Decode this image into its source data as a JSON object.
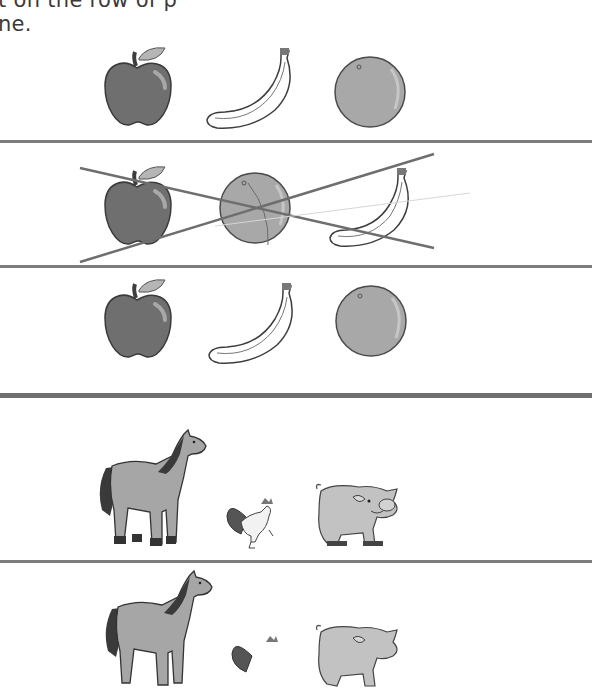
{
  "worksheet": {
    "instruction_line_1": "t on the row of p",
    "instruction_line_2": "ne."
  },
  "fruit_section": {
    "rows": [
      {
        "items": [
          "apple",
          "banana",
          "orange"
        ],
        "crossed_out": false
      },
      {
        "items": [
          "apple",
          "orange",
          "banana"
        ],
        "crossed_out": true
      },
      {
        "items": [
          "apple",
          "banana",
          "orange"
        ],
        "crossed_out": false
      }
    ]
  },
  "animal_section": {
    "rows": [
      {
        "items": [
          "horse",
          "rooster",
          "pig"
        ],
        "crossed_out": false
      },
      {
        "items": [
          "horse",
          "rooster",
          "pig"
        ],
        "crossed_out": false,
        "partially_visible": true
      }
    ]
  },
  "colors": {
    "rule": "#7d7d7d",
    "cross_mark": "#6e6e6e",
    "apple": "#6f6f6f",
    "orange": "#a8a8a8",
    "text": "#3a3a3a"
  }
}
